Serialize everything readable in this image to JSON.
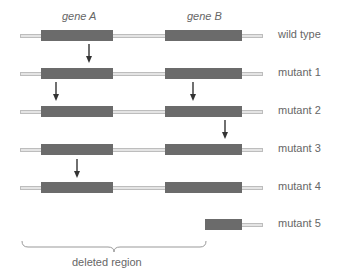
{
  "genes": [
    {
      "label": "gene A",
      "x": 62,
      "box_x": 41,
      "box_w": 72
    },
    {
      "label": "gene B",
      "x": 187,
      "box_x": 165,
      "box_w": 77
    }
  ],
  "rows": [
    {
      "label": "wild type",
      "y": 30,
      "arrows": []
    },
    {
      "label": "mutant 1",
      "y": 68,
      "arrows": [
        89
      ]
    },
    {
      "label": "mutant 2",
      "y": 106,
      "arrows": [
        56,
        193
      ]
    },
    {
      "label": "mutant 3",
      "y": 144,
      "arrows": [
        225
      ]
    },
    {
      "label": "mutant 4",
      "y": 182,
      "arrows": [
        77
      ]
    },
    {
      "label": "mutant 5",
      "y": 219,
      "arrows": []
    }
  ],
  "deleted_region": {
    "label": "deleted region"
  },
  "colors": {
    "gene": "#6b6b6b",
    "dna": "#e4e4e4",
    "arrow": "#333333"
  }
}
